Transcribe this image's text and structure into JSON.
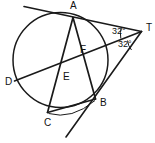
{
  "figure": {
    "type": "plane-geometry-diagram",
    "stroke_color": "#1a1a1a",
    "background_color": "#ffffff",
    "width": 155,
    "height": 143
  },
  "circle": {
    "name": "main-circle",
    "center_x": 60.5,
    "center_y": 60.0,
    "radius": 47.5
  },
  "points": [
    {
      "id": "A",
      "label": "A",
      "x": 73.0,
      "y": 17.5,
      "label_x": 70.0,
      "label_y": 8.5,
      "on_circle": true
    },
    {
      "id": "B",
      "label": "B",
      "x": 95.5,
      "y": 99.0,
      "label_x": 100.0,
      "label_y": 106.0,
      "on_circle": true
    },
    {
      "id": "C",
      "label": "C",
      "x": 47.5,
      "y": 112.5,
      "label_x": 44.0,
      "label_y": 126.0,
      "on_circle": true
    },
    {
      "id": "D",
      "label": "D",
      "x": 14.5,
      "y": 81.0,
      "label_x": 5.0,
      "label_y": 85.0,
      "on_circle": true
    },
    {
      "id": "E",
      "label": "E",
      "x": 60.0,
      "y": 74.5,
      "label_x": 63.0,
      "label_y": 80.0,
      "on_circle": false
    },
    {
      "id": "F",
      "label": "F",
      "x": 79.0,
      "y": 55.5,
      "label_x": 80.0,
      "label_y": 53.0,
      "on_circle": false
    },
    {
      "id": "T",
      "label": "T",
      "x": 141.5,
      "y": 31.5,
      "label_x": 146.0,
      "label_y": 31.0,
      "on_circle": false
    }
  ],
  "segments": [
    {
      "name": "tangent-through-A",
      "from_x": 24.0,
      "from_y": 6.5,
      "to_x": 141.5,
      "to_y": 31.5
    },
    {
      "name": "secant-T-F-E-D",
      "from_x": 141.5,
      "from_y": 31.5,
      "to_x": 14.5,
      "to_y": 81.0
    },
    {
      "name": "secant-T-B-extended",
      "from_x": 141.5,
      "from_y": 31.5,
      "to_x": 66.0,
      "to_y": 137.0
    },
    {
      "name": "chord-A-C",
      "from_x": 73.0,
      "from_y": 17.5,
      "to_x": 47.5,
      "to_y": 112.5
    },
    {
      "name": "chord-A-B",
      "from_x": 73.0,
      "from_y": 17.5,
      "to_x": 95.5,
      "to_y": 99.0
    },
    {
      "name": "chord-C-B",
      "from_x": 47.5,
      "from_y": 112.5,
      "to_x": 95.5,
      "to_y": 99.0
    }
  ],
  "angles": [
    {
      "id": "angle-ATF",
      "label": "32°",
      "value": 32,
      "unit": "degrees",
      "vertex": "T",
      "label_x": 112.0,
      "label_y": 33.5,
      "arc_path": "M 121.5 27.0 A 22 22 0 0 0 120.8 38.5"
    },
    {
      "id": "angle-FTB",
      "label": "32°",
      "value": 32,
      "unit": "degrees",
      "vertex": "T",
      "label_x": 118.0,
      "label_y": 46.5,
      "arc_path": "M 127.5 40.5 A 17 17 0 0 0 131.5 50.0"
    }
  ],
  "arc_marks": [
    {
      "name": "arc-mark-C-B-lower",
      "path": "M 48.5 113.5 Q 72 120 95.0 100.5"
    }
  ]
}
